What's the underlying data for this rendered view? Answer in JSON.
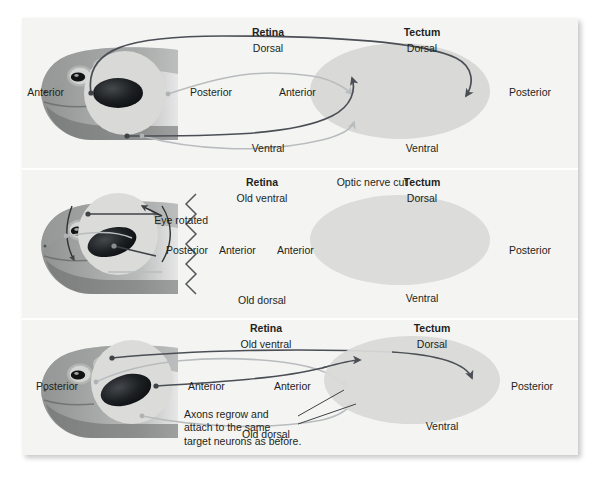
{
  "figure": {
    "background": "#f4f4f3",
    "text_color": "#231f20"
  },
  "colors": {
    "dark_axon": "#4b4f55",
    "light_axon": "#b9bcbe",
    "retina_fill": "#d9d9d7",
    "tectum_fill": "#d9d9d7",
    "pupil_dark": "#16181a",
    "frog_body": "#8d8f8e",
    "panel_bg": "#f4f4f3"
  },
  "panels": [
    {
      "id": "panel-normal",
      "name": "normal-projection",
      "retina": {
        "title": "Retina",
        "top_label": "Dorsal",
        "bottom_label": "Ventral",
        "left_label": "Anterior",
        "inner_label": "Posterior"
      },
      "tectum": {
        "title": "Tectum",
        "top_label": "Dorsal",
        "bottom_label": "Ventral",
        "left_label": "Anterior",
        "right_label": "Posterior"
      }
    },
    {
      "id": "panel-rotated-cut",
      "name": "eye-rotated-nerve-cut",
      "retina": {
        "title": "Retina",
        "top_label": "Old ventral",
        "bottom_label": "Old dorsal",
        "left_label": "Posterior",
        "right_label": "Anterior",
        "rotation_label": "Eye rotated"
      },
      "cut": {
        "label": "Optic nerve cut"
      },
      "tectum": {
        "title": "Tectum",
        "top_label": "Dorsal",
        "bottom_label": "Ventral",
        "left_label": "Anterior",
        "right_label": "Posterior"
      }
    },
    {
      "id": "panel-regrown",
      "name": "axons-regrown",
      "retina": {
        "title": "Retina",
        "top_label": "Old ventral",
        "bottom_label": "Old dorsal",
        "left_label": "Posterior",
        "right_label": "Anterior"
      },
      "tectum": {
        "title": "Tectum",
        "top_label": "Dorsal",
        "bottom_label": "Ventral",
        "left_label": "Anterior",
        "right_label": "Posterior"
      },
      "annotation": "Axons regrow and\nattach to the same\ntarget neurons as before."
    }
  ]
}
